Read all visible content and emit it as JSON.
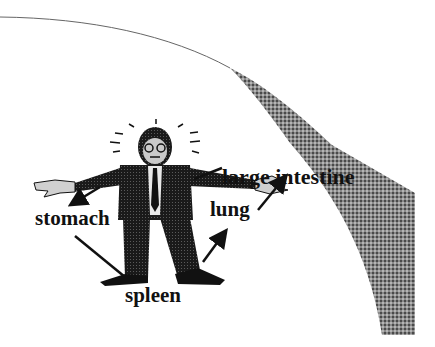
{
  "figure": {
    "colors": {
      "background": "#ffffff",
      "ink": "#111111",
      "page_curl_shade": "#7a7a7a"
    },
    "labels": {
      "large_intestine": "large intestine",
      "stomach": "stomach",
      "lung": "lung",
      "spleen": "spleen"
    },
    "arrows": [
      {
        "from": "large intestine",
        "to": "left shoulder of figure",
        "type": "line"
      },
      {
        "from": "stomach",
        "to": "figure left arm",
        "type": "arrow"
      },
      {
        "from": "stomach",
        "to": "figure left foot",
        "type": "line"
      },
      {
        "from": "lung",
        "to": "figure right hand",
        "type": "arrow"
      },
      {
        "from": "spleen",
        "to": "figure right leg",
        "type": "arrow"
      }
    ]
  }
}
